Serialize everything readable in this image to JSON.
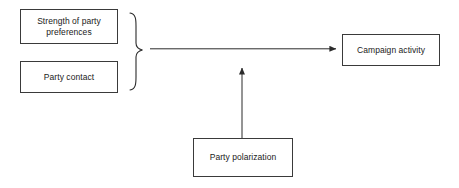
{
  "diagram": {
    "type": "conceptual-path-diagram",
    "background_color": "#ffffff",
    "line_color": "#3a3a3a",
    "text_color": "#1a1a1a",
    "nodes": [
      {
        "id": "strength",
        "label": "Strength of party\npreferences",
        "role": "predictor"
      },
      {
        "id": "contact",
        "label": "Party contact",
        "role": "predictor"
      },
      {
        "id": "campaign",
        "label": "Campaign activity",
        "role": "outcome"
      },
      {
        "id": "polarization",
        "label": "Party polarization",
        "role": "moderator"
      }
    ],
    "grouping": {
      "brace_shape": "right-curly-brace",
      "grouped_nodes": [
        "strength",
        "contact"
      ]
    },
    "connectors": [
      {
        "id": "main-effect-arrow",
        "from": "predictor-group-brace",
        "to": "campaign",
        "orientation": "horizontal",
        "arrowhead": "right"
      },
      {
        "id": "moderator-arrow",
        "from": "polarization",
        "to": "main-effect-arrow",
        "orientation": "vertical",
        "arrowhead": "up"
      }
    ]
  }
}
